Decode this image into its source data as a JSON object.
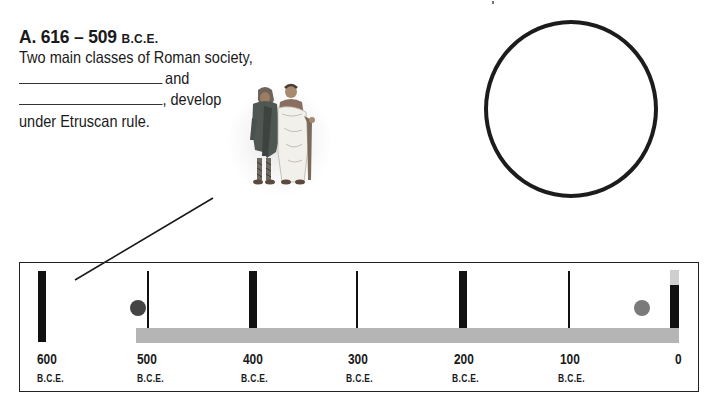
{
  "section": {
    "title_prefix": "A. 616 – 509",
    "title_era": "B.C.E.",
    "line1": "Two main classes of Roman society,",
    "line2_suffix": "and",
    "line3_suffix": ", develop",
    "line4": "under Etruscan rule."
  },
  "blanks": [
    {
      "label": "answer-blank-1",
      "value": ""
    },
    {
      "label": "answer-blank-2",
      "value": ""
    }
  ],
  "illustration": {
    "description": "Two Roman figures: a plebeian in a hooded cloak and a patrician in a white toga"
  },
  "answer_circle": {
    "stroke_color": "#1c1c1c"
  },
  "timeline": {
    "bar_color": "#b5b5b5",
    "ticks": [
      {
        "year": "600",
        "era": "B.C.E.",
        "style": "thick"
      },
      {
        "year": "500",
        "era": "B.C.E.",
        "style": "thin"
      },
      {
        "year": "400",
        "era": "B.C.E.",
        "style": "thick"
      },
      {
        "year": "300",
        "era": "B.C.E.",
        "style": "thin"
      },
      {
        "year": "200",
        "era": "B.C.E.",
        "style": "thick"
      },
      {
        "year": "100",
        "era": "B.C.E.",
        "style": "thin"
      },
      {
        "year": "0",
        "era": "",
        "style": "thick"
      }
    ],
    "events": [
      {
        "name": "event-dot-509bce",
        "color": "#444444"
      },
      {
        "name": "event-dot-27bce",
        "color": "#7a7a7a"
      }
    ]
  }
}
